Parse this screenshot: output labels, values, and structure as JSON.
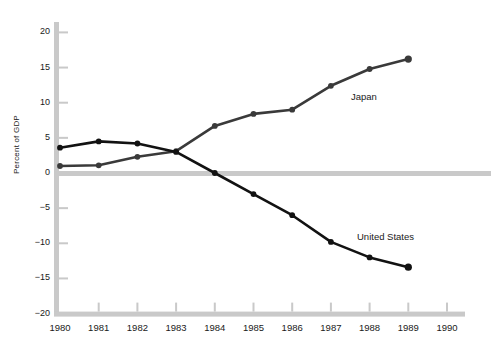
{
  "chart_data": {
    "type": "line",
    "title": "",
    "subtitle": "",
    "xlabel": "",
    "ylabel": "Percent of GDP",
    "x": [
      1980,
      1981,
      1982,
      1983,
      1984,
      1985,
      1986,
      1987,
      1988,
      1989
    ],
    "xtick_labels": [
      "1980",
      "1981",
      "1982",
      "1983",
      "1984",
      "1985",
      "1986",
      "1987",
      "1988",
      "1989",
      "1990"
    ],
    "ytick_labels": [
      "20",
      "15",
      "10",
      "5",
      "0",
      "−5",
      "−10",
      "−15",
      "−20"
    ],
    "ytick_values": [
      20,
      15,
      10,
      5,
      0,
      -5,
      -10,
      -15,
      -20
    ],
    "xlim": [
      1980,
      1990
    ],
    "ylim": [
      -20,
      20
    ],
    "grid": false,
    "legend_position": "inline-annotations",
    "zero_line": true,
    "series": [
      {
        "name": "Japan",
        "color": "#3a3a3a",
        "marker": "circle",
        "annotation": "Japan",
        "values": [
          1.0,
          1.1,
          2.3,
          3.1,
          6.7,
          8.4,
          9.0,
          12.4,
          14.8,
          16.2
        ]
      },
      {
        "name": "United States",
        "color": "#121212",
        "marker": "circle",
        "annotation": "United States",
        "values": [
          3.6,
          4.5,
          4.2,
          3.0,
          0.0,
          -3.0,
          -6.0,
          -9.8,
          -12.0,
          -13.4
        ]
      }
    ]
  },
  "axes": {
    "y_axis_title": "Percent of GDP",
    "spine_color": "#c9c9c9",
    "zero_line_color": "#c9c9c9",
    "tick_color": "#c9c9c9"
  },
  "annotations": {
    "japan_label": "Japan",
    "united_states_label": "United States"
  }
}
